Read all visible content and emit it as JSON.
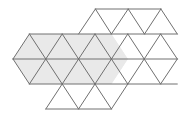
{
  "figure": {
    "canvas": {
      "width": 190,
      "height": 119,
      "background": "#ffffff"
    },
    "style": {
      "stroke_color": "#707070",
      "stroke_width": 1,
      "shaded_fill": "#e9e9e9",
      "unshaded_fill": "#ffffff"
    },
    "lattice": {
      "type": "triangular",
      "cell_width": 32.8,
      "row_height": 25,
      "origin_x": 13,
      "origin_y": 9,
      "rows": 5,
      "description": "Equilateral triangles tiled into two overlapping hexagonal clusters"
    },
    "regions": [
      {
        "name": "shaded-hexagon",
        "fill": "#e9e9e9",
        "position": "left",
        "vertices": "13,59 29.4,34 62.2,34 78.6,9 111.4,9 127.8,34 111.4,84 78.6,84 62.2,84 29.4,84",
        "triangle_count": 12
      },
      {
        "name": "unshaded-hexagon",
        "fill": "#ffffff",
        "position": "right",
        "triangle_count": 12
      }
    ],
    "rows_data": [
      {
        "index": 0,
        "y_top": 9,
        "y_bottom": 34,
        "x_start": 95.4,
        "x_end": 160.9,
        "triangles": 5
      },
      {
        "index": 1,
        "y_top": 34,
        "y_bottom": 59,
        "x_start": 29.4,
        "x_end": 177.3,
        "triangles": 11
      },
      {
        "index": 2,
        "y_top": 59,
        "y_bottom": 84,
        "x_start": 13.0,
        "x_end": 177.3,
        "triangles": 11
      },
      {
        "index": 3,
        "y_top": 84,
        "y_bottom": 109,
        "x_start": 45.8,
        "x_end": 111.4,
        "triangles": 5
      }
    ]
  }
}
